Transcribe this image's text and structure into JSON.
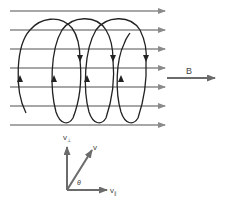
{
  "diagram": {
    "field_label": "B",
    "field_lines_count": 7,
    "colors": {
      "field_line": "#8a8a8a",
      "helix": "#222222",
      "vector": "#6b6b6b",
      "text": "#444444"
    },
    "vector_diagram": {
      "v_perp_label": "v",
      "v_perp_sub": "⊥",
      "v_label": "v",
      "v_par_label": "v",
      "v_par_sub": "∥",
      "angle_label": "θ"
    }
  }
}
